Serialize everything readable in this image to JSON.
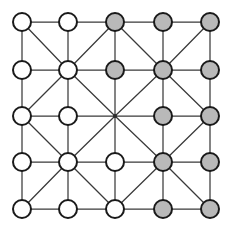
{
  "diagram": {
    "kind": "lattice-graph",
    "grid": {
      "rows": 5,
      "cols": 5,
      "x_positions": [
        22,
        68,
        115,
        163,
        210
      ],
      "y_positions": [
        22,
        70,
        116,
        162,
        209
      ],
      "node_radius": 9,
      "junction_radius": 2
    },
    "colors": {
      "node_white_fill": "#ffffff",
      "node_gray_fill": "#b9b9b9",
      "node_stroke": "#1a1a1a",
      "edge_stroke": "#3a3a3a",
      "background": "#ffffff",
      "junction_fill": "#2a2a2a"
    },
    "legend": {
      "white_label": "unfilled node",
      "gray_label": "filled node",
      "junction_label": "bare crossing point"
    },
    "nodes": [
      {
        "id": "r1c1",
        "row": 1,
        "col": 1,
        "state": "white",
        "shape": "circle"
      },
      {
        "id": "r1c2",
        "row": 1,
        "col": 2,
        "state": "white",
        "shape": "circle"
      },
      {
        "id": "r1c3",
        "row": 1,
        "col": 3,
        "state": "gray",
        "shape": "circle"
      },
      {
        "id": "r1c4",
        "row": 1,
        "col": 4,
        "state": "gray",
        "shape": "circle"
      },
      {
        "id": "r1c5",
        "row": 1,
        "col": 5,
        "state": "gray",
        "shape": "circle"
      },
      {
        "id": "r2c1",
        "row": 2,
        "col": 1,
        "state": "white",
        "shape": "circle"
      },
      {
        "id": "r2c2",
        "row": 2,
        "col": 2,
        "state": "white",
        "shape": "circle"
      },
      {
        "id": "r2c3",
        "row": 2,
        "col": 3,
        "state": "gray",
        "shape": "circle"
      },
      {
        "id": "r2c4",
        "row": 2,
        "col": 4,
        "state": "gray",
        "shape": "circle"
      },
      {
        "id": "r2c5",
        "row": 2,
        "col": 5,
        "state": "gray",
        "shape": "circle"
      },
      {
        "id": "r3c1",
        "row": 3,
        "col": 1,
        "state": "white",
        "shape": "circle"
      },
      {
        "id": "r3c2",
        "row": 3,
        "col": 2,
        "state": "white",
        "shape": "circle"
      },
      {
        "id": "r3c3",
        "row": 3,
        "col": 3,
        "state": "junction",
        "shape": "dot"
      },
      {
        "id": "r3c4",
        "row": 3,
        "col": 4,
        "state": "gray",
        "shape": "circle"
      },
      {
        "id": "r3c5",
        "row": 3,
        "col": 5,
        "state": "gray",
        "shape": "circle"
      },
      {
        "id": "r4c1",
        "row": 4,
        "col": 1,
        "state": "white",
        "shape": "circle"
      },
      {
        "id": "r4c2",
        "row": 4,
        "col": 2,
        "state": "white",
        "shape": "circle"
      },
      {
        "id": "r4c3",
        "row": 4,
        "col": 3,
        "state": "white",
        "shape": "circle"
      },
      {
        "id": "r4c4",
        "row": 4,
        "col": 4,
        "state": "gray",
        "shape": "circle"
      },
      {
        "id": "r4c5",
        "row": 4,
        "col": 5,
        "state": "gray",
        "shape": "circle"
      },
      {
        "id": "r5c1",
        "row": 5,
        "col": 1,
        "state": "white",
        "shape": "circle"
      },
      {
        "id": "r5c2",
        "row": 5,
        "col": 2,
        "state": "white",
        "shape": "circle"
      },
      {
        "id": "r5c3",
        "row": 5,
        "col": 3,
        "state": "white",
        "shape": "circle"
      },
      {
        "id": "r5c4",
        "row": 5,
        "col": 4,
        "state": "gray",
        "shape": "circle"
      },
      {
        "id": "r5c5",
        "row": 5,
        "col": 5,
        "state": "gray",
        "shape": "circle"
      }
    ],
    "edges_horizontal": [
      [
        "r1c1",
        "r1c2"
      ],
      [
        "r1c2",
        "r1c3"
      ],
      [
        "r1c3",
        "r1c4"
      ],
      [
        "r1c4",
        "r1c5"
      ],
      [
        "r2c1",
        "r2c2"
      ],
      [
        "r2c2",
        "r2c3"
      ],
      [
        "r2c3",
        "r2c4"
      ],
      [
        "r2c4",
        "r2c5"
      ],
      [
        "r3c1",
        "r3c2"
      ],
      [
        "r3c2",
        "r3c3"
      ],
      [
        "r3c3",
        "r3c4"
      ],
      [
        "r3c4",
        "r3c5"
      ],
      [
        "r4c1",
        "r4c2"
      ],
      [
        "r4c2",
        "r4c3"
      ],
      [
        "r4c3",
        "r4c4"
      ],
      [
        "r4c4",
        "r4c5"
      ],
      [
        "r5c1",
        "r5c2"
      ],
      [
        "r5c2",
        "r5c3"
      ],
      [
        "r5c3",
        "r5c4"
      ],
      [
        "r5c4",
        "r5c5"
      ]
    ],
    "edges_vertical": [
      [
        "r1c1",
        "r2c1"
      ],
      [
        "r2c1",
        "r3c1"
      ],
      [
        "r3c1",
        "r4c1"
      ],
      [
        "r4c1",
        "r5c1"
      ],
      [
        "r1c2",
        "r2c2"
      ],
      [
        "r2c2",
        "r3c2"
      ],
      [
        "r3c2",
        "r4c2"
      ],
      [
        "r4c2",
        "r5c2"
      ],
      [
        "r1c3",
        "r2c3"
      ],
      [
        "r2c3",
        "r3c3"
      ],
      [
        "r3c3",
        "r4c3"
      ],
      [
        "r4c3",
        "r5c3"
      ],
      [
        "r1c4",
        "r2c4"
      ],
      [
        "r2c4",
        "r3c4"
      ],
      [
        "r3c4",
        "r4c4"
      ],
      [
        "r4c4",
        "r5c4"
      ],
      [
        "r1c5",
        "r2c5"
      ],
      [
        "r2c5",
        "r3c5"
      ],
      [
        "r3c5",
        "r4c5"
      ],
      [
        "r4c5",
        "r5c5"
      ]
    ],
    "edges_diagonal": [
      [
        "r1c1",
        "r2c2"
      ],
      [
        "r1c3",
        "r2c2"
      ],
      [
        "r3c1",
        "r2c2"
      ],
      [
        "r3c3",
        "r2c2"
      ],
      [
        "r1c3",
        "r2c4"
      ],
      [
        "r1c5",
        "r2c4"
      ],
      [
        "r3c3",
        "r2c4"
      ],
      [
        "r3c5",
        "r2c4"
      ],
      [
        "r3c1",
        "r4c2"
      ],
      [
        "r3c3",
        "r4c2"
      ],
      [
        "r5c1",
        "r4c2"
      ],
      [
        "r5c3",
        "r4c2"
      ],
      [
        "r3c3",
        "r4c4"
      ],
      [
        "r3c5",
        "r4c4"
      ],
      [
        "r5c3",
        "r4c4"
      ],
      [
        "r5c5",
        "r4c4"
      ]
    ]
  }
}
